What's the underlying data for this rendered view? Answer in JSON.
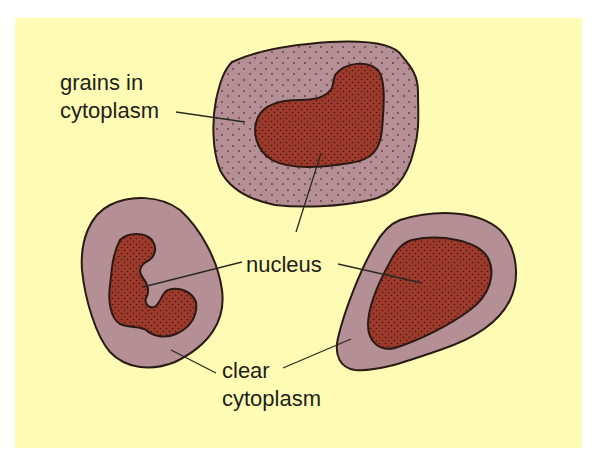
{
  "diagram": {
    "type": "cell-structure-illustration",
    "background_color": "#fefcb4",
    "page_color": "#ffffff",
    "colors": {
      "cytoplasm": "#b48f96",
      "nucleus": "#9c3a2c",
      "outline": "#2a1a14",
      "leader_line": "#2a2a20",
      "granule_dot": "#6b3a40",
      "nucleus_dot": "#4a1410",
      "text": "#1f1f1a"
    },
    "labels": {
      "grains_line1": "grains in",
      "grains_line2": "cytoplasm",
      "nucleus": "nucleus",
      "clear_line1": "clear",
      "clear_line2": "cytoplasm"
    },
    "cells": [
      {
        "id": "granular-cell",
        "position": "top-center",
        "cytoplasm": "granular",
        "nucleus_shape": "kidney / bent"
      },
      {
        "id": "lobed-cell",
        "position": "bottom-left",
        "cytoplasm": "clear",
        "nucleus_shape": "lobed"
      },
      {
        "id": "round-cell",
        "position": "bottom-right",
        "cytoplasm": "clear",
        "nucleus_shape": "large oval"
      }
    ],
    "connections": [
      {
        "from": "grains in cytoplasm",
        "to": "granular-cell cytoplasm"
      },
      {
        "from": "nucleus",
        "to": "granular-cell nucleus"
      },
      {
        "from": "nucleus",
        "to": "lobed-cell nucleus"
      },
      {
        "from": "nucleus",
        "to": "round-cell nucleus"
      },
      {
        "from": "clear cytoplasm",
        "to": "lobed-cell cytoplasm"
      },
      {
        "from": "clear cytoplasm",
        "to": "round-cell cytoplasm"
      }
    ]
  }
}
